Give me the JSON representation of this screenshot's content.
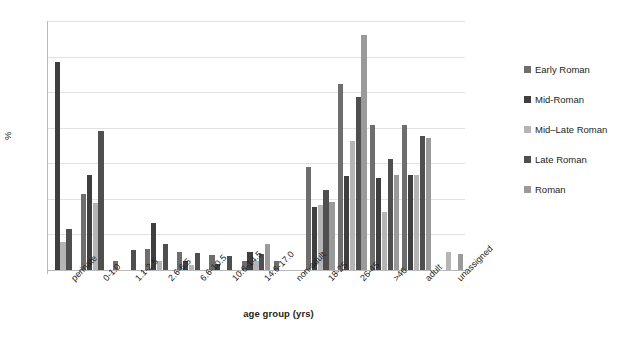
{
  "chart_data": {
    "type": "bar",
    "title": "",
    "xlabel": "age group (yrs)",
    "ylabel": "%",
    "ylim": [
      0,
      35
    ],
    "yticks": [
      0,
      5,
      10,
      15,
      20,
      25,
      30,
      35
    ],
    "grid": true,
    "legend_position": "right",
    "categories": [
      "perinate",
      "0-1.0",
      "1.1-2.5",
      "2.6-6.5",
      "6.6-10.5",
      "10.6-14.5",
      "14.6-17.0",
      "non-adult",
      "18-25",
      "26-45",
      ">46",
      "adult",
      "unassigned"
    ],
    "series": [
      {
        "name": "Early Roman",
        "color": "#6e6e6e",
        "values": [
          null,
          10.7,
          1.2,
          2.9,
          2.5,
          2.1,
          1.3,
          1.3,
          14.5,
          26.1,
          20.4,
          20.4,
          null
        ]
      },
      {
        "name": "Mid-Roman",
        "color": "#3f3f3f",
        "values": [
          29.2,
          13.3,
          null,
          6.6,
          1.2,
          0.8,
          2.6,
          null,
          8.9,
          13.2,
          13.0,
          13.3,
          null
        ]
      },
      {
        "name": "Mid–Late Roman",
        "color": "#b5b5b5",
        "values": [
          3.9,
          9.4,
          null,
          1.3,
          0.7,
          null,
          1.2,
          null,
          9.1,
          18.2,
          8.2,
          13.3,
          2.5
        ]
      },
      {
        "name": "Late Roman",
        "color": "#4f4f4f",
        "values": [
          5.8,
          19.6,
          2.8,
          3.7,
          2.4,
          2.0,
          2.3,
          null,
          11.2,
          24.3,
          15.6,
          18.8,
          null
        ]
      },
      {
        "name": "Roman",
        "color": "#9a9a9a",
        "values": [
          null,
          null,
          null,
          null,
          null,
          null,
          3.6,
          null,
          9.5,
          33.1,
          13.4,
          18.6,
          2.3
        ]
      }
    ]
  },
  "legend": {
    "items": [
      {
        "label": "Early Roman",
        "color": "#6e6e6e"
      },
      {
        "label": "Mid-Roman",
        "color": "#3f3f3f"
      },
      {
        "label": "Mid–Late Roman",
        "color": "#b5b5b5"
      },
      {
        "label": "Late Roman",
        "color": "#4f4f4f"
      },
      {
        "label": "Roman",
        "color": "#9a9a9a"
      }
    ]
  },
  "axes": {
    "y_title": "%",
    "x_title": "age group (yrs)"
  }
}
